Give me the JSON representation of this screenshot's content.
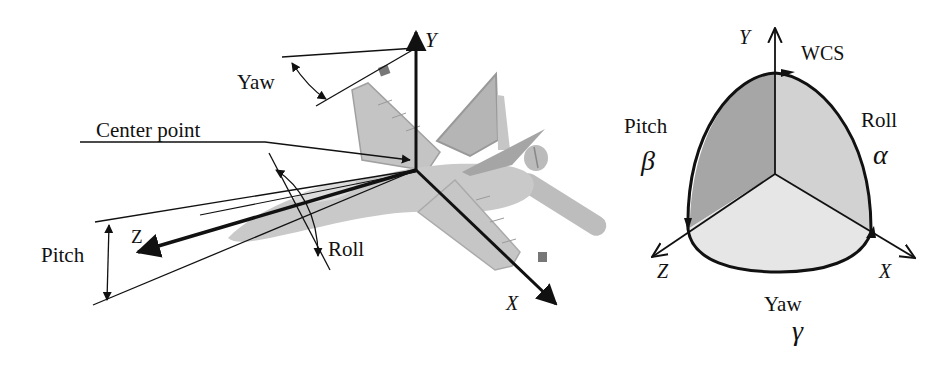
{
  "left_diagram": {
    "title": "Aircraft rotation axes",
    "labels": {
      "y_axis": "Y",
      "x_axis": "X",
      "z_axis": "Z",
      "yaw": "Yaw",
      "center_point": "Center point",
      "pitch": "Pitch",
      "roll": "Roll"
    }
  },
  "right_diagram": {
    "title": "Euler angle sphere in WCS",
    "labels": {
      "y_axis": "Y",
      "x_axis": "X",
      "z_axis": "Z",
      "wcs": "WCS",
      "pitch": "Pitch",
      "pitch_symbol": "β",
      "roll": "Roll",
      "roll_symbol": "α",
      "yaw": "Yaw",
      "yaw_symbol": "γ"
    }
  },
  "colors": {
    "ink": "#111111",
    "plane_light": "#cfcfcf",
    "plane_mid": "#b5b5b5",
    "plane_dark": "#9a9a9a",
    "sphere_pitch": "#a6a6a6",
    "sphere_roll": "#d2d2d2",
    "sphere_yaw": "#e6e6e6"
  }
}
